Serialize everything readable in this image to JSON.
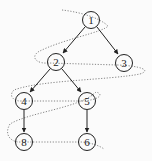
{
  "diagram": {
    "type": "binary-tree-level-order-traversal",
    "nodes": [
      {
        "id": "n1",
        "label": "1",
        "x": 91,
        "y": 20
      },
      {
        "id": "n2",
        "label": "2",
        "x": 56,
        "y": 62
      },
      {
        "id": "n3",
        "label": "3",
        "x": 124,
        "y": 63
      },
      {
        "id": "n4",
        "label": "4",
        "x": 24,
        "y": 101
      },
      {
        "id": "n5",
        "label": "5",
        "x": 87,
        "y": 101
      },
      {
        "id": "n8",
        "label": "8",
        "x": 24,
        "y": 142
      },
      {
        "id": "n6",
        "label": "6",
        "x": 87,
        "y": 142
      }
    ],
    "edges": [
      {
        "from": "1",
        "to": "2"
      },
      {
        "from": "1",
        "to": "3"
      },
      {
        "from": "2",
        "to": "4"
      },
      {
        "from": "2",
        "to": "5"
      },
      {
        "from": "4",
        "to": "8"
      },
      {
        "from": "5",
        "to": "6"
      }
    ],
    "traversal_path": "dotted zig-zag: 1 → 2 → 3 → 4 → 5 → 8 → 6",
    "colors": {
      "stroke": "#222222",
      "dotted": "#777777",
      "background": "#fbfbfb"
    }
  }
}
